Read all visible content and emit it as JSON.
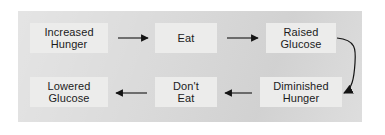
{
  "diagram": {
    "panel_background": "#d9d9d9",
    "node_background": "#ececeb",
    "text_color": "#1b1b1b",
    "edge_color": "#141414",
    "nodes": [
      {
        "id": "increased-hunger",
        "line1": "Increased",
        "line2": "Hunger"
      },
      {
        "id": "eat",
        "line1": "Eat",
        "line2": ""
      },
      {
        "id": "raised-glucose",
        "line1": "Raised",
        "line2": "Glucose"
      },
      {
        "id": "diminished-hunger",
        "line1": "Diminished",
        "line2": "Hunger"
      },
      {
        "id": "dont-eat",
        "line1": "Don't",
        "line2": "Eat"
      },
      {
        "id": "lowered-glucose",
        "line1": "Lowered",
        "line2": "Glucose"
      }
    ],
    "edges": [
      {
        "id": "increased-hunger-to-eat",
        "from": "increased-hunger",
        "to": "eat",
        "shape": "straight",
        "direction": "right"
      },
      {
        "id": "eat-to-raised-glucose",
        "from": "eat",
        "to": "raised-glucose",
        "shape": "straight",
        "direction": "right"
      },
      {
        "id": "raised-glucose-to-diminished",
        "from": "raised-glucose",
        "to": "diminished-hunger",
        "shape": "curved",
        "direction": "down-left"
      },
      {
        "id": "diminished-hunger-to-dont-eat",
        "from": "diminished-hunger",
        "to": "dont-eat",
        "shape": "straight",
        "direction": "left"
      },
      {
        "id": "dont-eat-to-lowered-glucose",
        "from": "dont-eat",
        "to": "lowered-glucose",
        "shape": "straight",
        "direction": "left"
      }
    ]
  }
}
